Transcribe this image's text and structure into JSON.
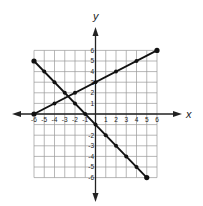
{
  "chart_data": {
    "type": "line",
    "title": "",
    "xlabel": "x",
    "ylabel": "y",
    "xlim": [
      -6,
      6
    ],
    "ylim": [
      -6,
      6
    ],
    "grid": true,
    "legend": null,
    "x_ticks": [
      "-6",
      "-5",
      "-4",
      "-3",
      "-2",
      "-1",
      "1",
      "2",
      "3",
      "4",
      "5",
      "6"
    ],
    "y_ticks": [
      "6",
      "5",
      "4",
      "3",
      "2",
      "1",
      "-2",
      "-3",
      "-4",
      "-5",
      "-6"
    ],
    "series": [
      {
        "name": "line-1",
        "equation": "y = 0.5x + 3",
        "points": [
          [
            -6,
            0
          ],
          [
            -4,
            1
          ],
          [
            -2,
            2
          ],
          [
            0,
            3
          ],
          [
            2,
            4
          ],
          [
            4,
            5
          ],
          [
            6,
            6
          ]
        ]
      },
      {
        "name": "line-2",
        "equation": "y = -x - 1",
        "points": [
          [
            -6,
            5
          ],
          [
            -5,
            4
          ],
          [
            -4,
            3
          ],
          [
            -3,
            2
          ],
          [
            -2,
            1
          ],
          [
            -1,
            0
          ],
          [
            0,
            -1
          ],
          [
            1,
            -2
          ],
          [
            2,
            -3
          ],
          [
            3,
            -4
          ],
          [
            4,
            -5
          ],
          [
            5,
            -6
          ]
        ]
      }
    ],
    "annotations": []
  },
  "colors": {
    "grid": "#9a9a9a",
    "axis": "#222222",
    "line": "#111111"
  }
}
